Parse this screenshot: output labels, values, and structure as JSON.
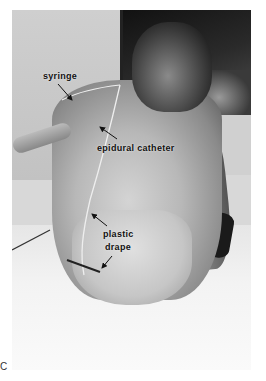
{
  "figure": {
    "panel_letter": "C",
    "labels": {
      "syringe": "syringe",
      "epidural_catheter": "epidural catheter",
      "plastic_drape_line1": "plastic",
      "plastic_drape_line2": "drape"
    }
  }
}
